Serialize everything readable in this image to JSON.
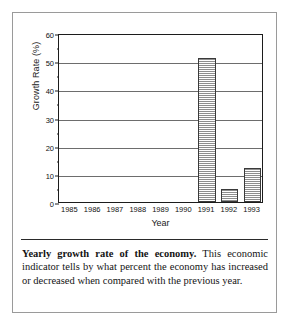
{
  "figure": {
    "caption_lead": "Yearly growth rate of the economy.",
    "caption_body": " This economic indicator tells by what percent the economy has increased or decreased when compared with the previous year."
  },
  "chart_data": {
    "type": "bar",
    "title": "",
    "xlabel": "Year",
    "ylabel": "Growth Rate (%)",
    "categories": [
      "1985",
      "1986",
      "1987",
      "1988",
      "1989",
      "1990",
      "1991",
      "1992",
      "1993"
    ],
    "values": [
      0,
      0,
      0,
      0,
      0,
      0,
      51,
      4.5,
      12
    ],
    "ylim": [
      0,
      60
    ],
    "ytick_values": [
      0,
      10,
      20,
      30,
      40,
      50,
      60
    ],
    "ytick_labels": [
      "0",
      "10",
      "20",
      "30",
      "40",
      "50",
      "60"
    ],
    "yminor_step": 5,
    "grid": "horizontal",
    "legend": "none",
    "bar_fill": "#8e8e8e",
    "bar_edge": "#3a3a3a",
    "axis_color": "#1c1c1c",
    "gridline_color": "#6d6d6d"
  }
}
